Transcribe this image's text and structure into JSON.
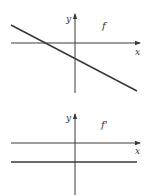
{
  "diagram": {
    "colors": {
      "stroke": "#3a3a3a",
      "background": "#ffffff"
    },
    "graphs": [
      {
        "name": "f",
        "function_label": "f",
        "x_axis_label": "x",
        "y_axis_label": "y",
        "description": "Decreasing straight line with negative slope, crossing the x-axis left of the origin and the y-axis below the origin"
      },
      {
        "name": "f-prime",
        "function_label": "f'",
        "x_axis_label": "x",
        "y_axis_label": "y",
        "description": "Horizontal line below the x-axis (constant negative derivative)"
      }
    ]
  }
}
